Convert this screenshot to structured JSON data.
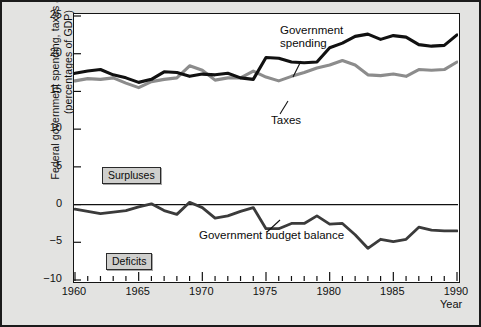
{
  "figure": {
    "background_color": "#e3e3e1",
    "plot_background_color": "#ffffff",
    "border_color": "#1b1b1b"
  },
  "axis": {
    "ylabel_line1": "Federal government spending, taxes and balance",
    "ylabel_line2": "(percentages of GDP)",
    "xlabel": "Year",
    "yticks": [
      "25",
      "20",
      "15",
      "10",
      "5",
      "0",
      "−5",
      "−10"
    ],
    "xticks": [
      "1960",
      "1965",
      "1970",
      "1975",
      "1980",
      "1985",
      "1990"
    ]
  },
  "annotations": {
    "spending_label_line1": "Government",
    "spending_label_line2": "spending",
    "taxes_label": "Taxes",
    "balance_label": "Government budget balance",
    "surpluses_tag": "Surpluses",
    "deficits_tag": "Deficits"
  },
  "colors": {
    "spending": "#111111",
    "taxes": "#8c8c8c",
    "balance": "#3b3b3b",
    "zero_line": "#111111",
    "tag_fill": "#cfcfcd"
  },
  "chart_data": {
    "type": "line",
    "title": "",
    "xlabel": "Year",
    "ylabel": "Federal government spending, taxes and balance (percentages of GDP)",
    "xlim": [
      1960,
      1990
    ],
    "ylim": [
      -10,
      25
    ],
    "grid": false,
    "legend": "inline-annotations",
    "x": [
      1960,
      1961,
      1962,
      1963,
      1964,
      1965,
      1966,
      1967,
      1968,
      1969,
      1970,
      1971,
      1972,
      1973,
      1974,
      1975,
      1976,
      1977,
      1978,
      1979,
      1980,
      1981,
      1982,
      1983,
      1984,
      1985,
      1986,
      1987,
      1988,
      1989,
      1990
    ],
    "series": [
      {
        "name": "Government spending",
        "color": "#111111",
        "values": [
          17.4,
          17.7,
          17.9,
          17.2,
          16.8,
          16.2,
          16.6,
          17.6,
          17.5,
          17.0,
          17.3,
          17.2,
          17.4,
          16.8,
          16.6,
          19.5,
          19.4,
          18.9,
          18.8,
          18.9,
          20.8,
          21.4,
          22.3,
          22.6,
          21.9,
          22.4,
          22.2,
          21.2,
          21.0,
          21.1,
          22.5
        ]
      },
      {
        "name": "Taxes",
        "color": "#8c8c8c",
        "values": [
          16.4,
          16.7,
          16.6,
          16.8,
          16.1,
          15.5,
          16.3,
          16.6,
          16.8,
          18.4,
          17.8,
          16.5,
          16.8,
          16.8,
          17.7,
          16.9,
          16.4,
          17.0,
          17.5,
          18.1,
          18.5,
          19.1,
          18.5,
          17.2,
          17.1,
          17.3,
          17.0,
          17.9,
          17.8,
          17.9,
          18.9
        ]
      },
      {
        "name": "Government budget balance",
        "color": "#3b3b3b",
        "values": [
          -0.6,
          -0.9,
          -1.2,
          -1.0,
          -0.8,
          -0.3,
          0.1,
          -0.8,
          -1.3,
          0.3,
          -0.4,
          -1.8,
          -1.5,
          -0.9,
          -0.4,
          -3.2,
          -3.2,
          -2.5,
          -2.5,
          -1.5,
          -2.6,
          -2.5,
          -4.0,
          -5.8,
          -4.6,
          -4.9,
          -4.6,
          -3.0,
          -3.4,
          -3.5,
          -3.5
        ]
      }
    ]
  }
}
